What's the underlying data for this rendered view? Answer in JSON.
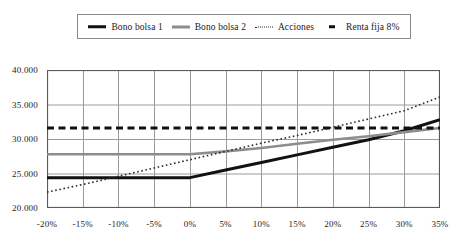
{
  "legend": {
    "position": "top",
    "items": [
      {
        "label": "Bono bolsa 1",
        "style": "solid-thick",
        "color": "#111111",
        "icon": "line-solid-thick-icon"
      },
      {
        "label": "Bono bolsa 2",
        "style": "solid-gray",
        "color": "#8d8d8d",
        "icon": "line-solid-gray-icon"
      },
      {
        "label": "Acciones",
        "style": "dotted",
        "color": "#2b2b2b",
        "icon": "line-dotted-icon"
      },
      {
        "label": "Renta fija 8%",
        "style": "dashed",
        "color": "#111111",
        "icon": "line-dashed-icon"
      }
    ]
  },
  "axes": {
    "y_ticks": [
      "40.000",
      "35.000",
      "30.000",
      "25.000",
      "20.000"
    ],
    "x_ticks": [
      "-20%",
      "-15%",
      "-10%",
      "-5%",
      "0%",
      "5%",
      "10%",
      "15%",
      "20%",
      "25%",
      "30%",
      "35%"
    ]
  },
  "chart_data": {
    "type": "line",
    "title": "",
    "subtitle": "",
    "xlabel": "",
    "ylabel": "",
    "xlim": [
      -20,
      35
    ],
    "ylim": [
      20000,
      40000
    ],
    "ytick_values": [
      20000,
      25000,
      30000,
      35000,
      40000
    ],
    "grid": true,
    "legend_position": "top",
    "x": [
      -20,
      -15,
      -10,
      -5,
      0,
      5,
      10,
      15,
      20,
      25,
      30,
      35
    ],
    "series": [
      {
        "name": "Bono bolsa 1",
        "color": "#111111",
        "style": "solid",
        "width": 3,
        "values": [
          24400,
          24400,
          24400,
          24400,
          24400,
          25500,
          26600,
          27700,
          28800,
          29900,
          31200,
          32800
        ]
      },
      {
        "name": "Bono bolsa 2",
        "color": "#8d8d8d",
        "style": "solid",
        "width": 2.6,
        "values": [
          27800,
          27800,
          27800,
          27800,
          27800,
          28200,
          28700,
          29300,
          29900,
          30400,
          31000,
          31600
        ]
      },
      {
        "name": "Acciones",
        "color": "#2b2b2b",
        "style": "dotted",
        "width": 1.6,
        "values": [
          22300,
          23400,
          24600,
          25800,
          27000,
          28200,
          29400,
          30500,
          31700,
          32900,
          34100,
          36100
        ]
      },
      {
        "name": "Renta fija 8%",
        "color": "#111111",
        "style": "dashed",
        "width": 3,
        "values": [
          31600,
          31600,
          31600,
          31600,
          31600,
          31600,
          31600,
          31600,
          31600,
          31600,
          31600,
          31600
        ]
      }
    ]
  }
}
